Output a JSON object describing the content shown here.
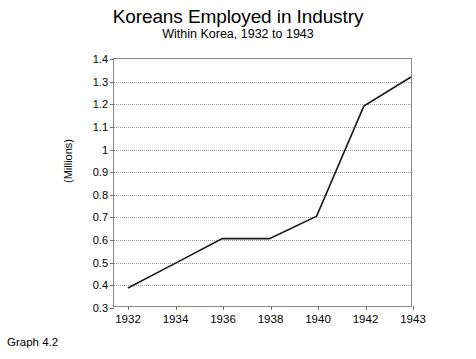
{
  "caption": "Graph 4.2",
  "chart_data": {
    "type": "line",
    "title": "Koreans Employed in Industry",
    "subtitle": "Within Korea, 1932 to 1943",
    "xlabel": "",
    "ylabel": "(Millions)",
    "categories": [
      "1932",
      "1934",
      "1936",
      "1938",
      "1940",
      "1942",
      "1943"
    ],
    "x": [
      1932,
      1934,
      1936,
      1938,
      1940,
      1942,
      1943
    ],
    "values": [
      0.38,
      0.49,
      0.6,
      0.6,
      0.7,
      1.19,
      1.32
    ],
    "series": [
      {
        "name": "Koreans employed in industry",
        "values": [
          0.38,
          0.49,
          0.6,
          0.6,
          0.7,
          1.19,
          1.32
        ]
      }
    ],
    "ylim": [
      0.3,
      1.4
    ],
    "ytick_values": [
      0.3,
      0.4,
      0.5,
      0.6,
      0.7,
      0.8,
      0.9,
      1.0,
      1.1,
      1.2,
      1.3,
      1.4
    ],
    "ytick_labels": [
      "0.3",
      "0.4",
      "0.5",
      "0.6",
      "0.7",
      "0.8",
      "0.9",
      "1",
      "1.1",
      "1.2",
      "1.3",
      "1.4"
    ],
    "grid": true,
    "grid_axis": "y",
    "legend": "none",
    "line_color": "#1a1a1a",
    "grid_color": "#9b9b9b",
    "frame_color": "#8a8a8a",
    "background_color": "#ffffff"
  }
}
